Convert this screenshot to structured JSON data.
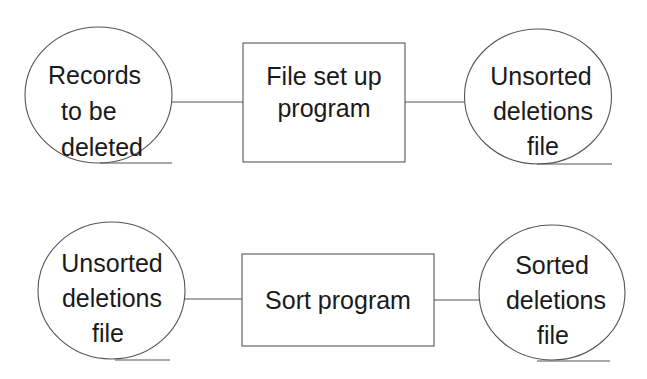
{
  "diagram": {
    "type": "system-flowchart",
    "colors": {
      "stroke": "#555555",
      "text": "#1a1a1a",
      "background": "#ffffff"
    },
    "rows": [
      {
        "input": {
          "symbol": "magnetic-tape",
          "lines": [
            "Records",
            "to be",
            "deleted"
          ]
        },
        "process": {
          "symbol": "process-box",
          "lines": [
            "File set up",
            "program"
          ]
        },
        "output": {
          "symbol": "magnetic-tape",
          "lines": [
            "Unsorted",
            "deletions",
            "file"
          ]
        }
      },
      {
        "input": {
          "symbol": "magnetic-tape",
          "lines": [
            "Unsorted",
            "deletions",
            "file"
          ]
        },
        "process": {
          "symbol": "process-box",
          "lines": [
            "Sort program"
          ]
        },
        "output": {
          "symbol": "magnetic-tape",
          "lines": [
            "Sorted",
            "deletions",
            "file"
          ]
        }
      }
    ],
    "edges": [
      {
        "from": "Records to be deleted",
        "to": "File set up program"
      },
      {
        "from": "File set up program",
        "to": "Unsorted deletions file"
      },
      {
        "from": "Unsorted deletions file",
        "to": "Sort program"
      },
      {
        "from": "Sort program",
        "to": "Sorted deletions file"
      }
    ]
  }
}
